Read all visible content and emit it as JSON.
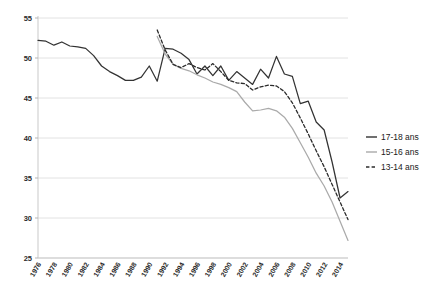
{
  "chart_data": {
    "type": "line",
    "title": "",
    "subtitle": "",
    "xlabel": "",
    "ylabel": "",
    "xlim": [
      1976,
      2015
    ],
    "ylim": [
      25,
      55
    ],
    "yticks": [
      25,
      30,
      35,
      40,
      45,
      50,
      55
    ],
    "ytick_labels": [
      "25",
      "30",
      "35",
      "40",
      "45",
      "50",
      "55"
    ],
    "xticks": [
      1976,
      1978,
      1980,
      1982,
      1984,
      1986,
      1988,
      1990,
      1992,
      1994,
      1996,
      1998,
      2000,
      2002,
      2004,
      2006,
      2008,
      2010,
      2012,
      2014
    ],
    "xtick_labels": [
      "1976",
      "1978",
      "1980",
      "1982",
      "1984",
      "1986",
      "1988",
      "1990",
      "1992",
      "1994",
      "1996",
      "1998",
      "2000",
      "2002",
      "2004",
      "2006",
      "2008",
      "2010",
      "2012",
      "2014"
    ],
    "grid": "horizontal",
    "legend_position": "right",
    "series": [
      {
        "name": "17-18 ans",
        "style": "solid",
        "color": "#333333",
        "x": [
          1976,
          1977,
          1978,
          1979,
          1980,
          1981,
          1982,
          1983,
          1984,
          1985,
          1986,
          1987,
          1988,
          1989,
          1990,
          1991,
          1992,
          1993,
          1994,
          1995,
          1996,
          1997,
          1998,
          1999,
          2000,
          2001,
          2002,
          2003,
          2004,
          2005,
          2006,
          2007,
          2008,
          2009,
          2010,
          2011,
          2012,
          2013,
          2014,
          2015
        ],
        "values": [
          52.2,
          52.1,
          51.6,
          52.0,
          51.5,
          51.4,
          51.2,
          50.3,
          49.0,
          48.3,
          47.8,
          47.2,
          47.2,
          47.6,
          49.0,
          47.1,
          51.2,
          51.1,
          50.6,
          49.8,
          48.0,
          49.0,
          47.8,
          49.0,
          47.2,
          48.3,
          47.5,
          46.7,
          48.6,
          47.5,
          50.2,
          48.0,
          47.7,
          44.3,
          44.6,
          42.0,
          41.0,
          37.0,
          32.5,
          33.3
        ]
      },
      {
        "name": "15-16 ans",
        "style": "solid",
        "color": "#aaaaaa",
        "x": [
          1991,
          1992,
          1993,
          1994,
          1995,
          1996,
          1997,
          1998,
          1999,
          2000,
          2001,
          2002,
          2003,
          2004,
          2005,
          2006,
          2007,
          2008,
          2009,
          2010,
          2011,
          2012,
          2013,
          2014,
          2015
        ],
        "values": [
          52.7,
          50.5,
          49.2,
          48.7,
          48.4,
          47.9,
          47.5,
          47.0,
          46.7,
          46.3,
          45.8,
          44.5,
          43.4,
          43.5,
          43.7,
          43.4,
          42.6,
          41.2,
          39.4,
          37.6,
          35.6,
          34.0,
          32.0,
          29.6,
          27.2
        ]
      },
      {
        "name": "13-14 ans",
        "style": "dashed",
        "color": "#2b2b2b",
        "x": [
          1991,
          1992,
          1993,
          1994,
          1995,
          1996,
          1997,
          1998,
          1999,
          2000,
          2001,
          2002,
          2003,
          2004,
          2005,
          2006,
          2007,
          2008,
          2009,
          2010,
          2011,
          2012,
          2013,
          2014,
          2015
        ],
        "values": [
          53.5,
          51.0,
          49.2,
          48.8,
          49.3,
          48.8,
          48.5,
          49.3,
          48.3,
          47.2,
          46.9,
          46.8,
          46.0,
          46.4,
          46.6,
          46.5,
          45.8,
          44.4,
          42.5,
          40.5,
          38.4,
          36.4,
          34.2,
          32.0,
          29.8
        ]
      }
    ]
  },
  "legend": {
    "items": [
      {
        "label": "17-18 ans"
      },
      {
        "label": "15-16 ans"
      },
      {
        "label": "13-14 ans"
      }
    ]
  }
}
